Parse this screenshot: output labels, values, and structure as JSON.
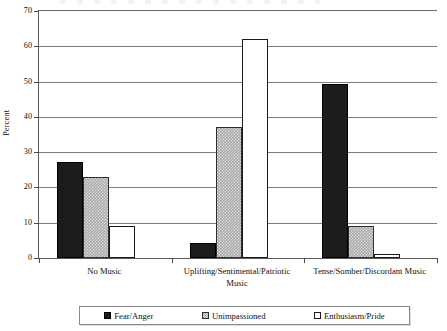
{
  "chart_data": {
    "type": "bar",
    "title": "",
    "xlabel": "",
    "ylabel": "Percent",
    "ylim": [
      0,
      70
    ],
    "ytick_step": 10,
    "yticks": [
      "0",
      "10",
      "20",
      "30",
      "40",
      "50",
      "60",
      "70"
    ],
    "grid": true,
    "legend_position": "bottom",
    "categories": [
      "No Music",
      "Uplifting/Sentimental/Patriotic Music",
      "Tense/Somber/Discordant Music"
    ],
    "category_lines": [
      [
        "No Music"
      ],
      [
        "Uplifting/Sentimental/Patriotic",
        "Music"
      ],
      [
        "Tense/Somber/Discordant Music"
      ]
    ],
    "series": [
      {
        "name": "Fear/Anger",
        "fill": "fill-dark",
        "values": [
          27.3,
          4.2,
          49.3
        ]
      },
      {
        "name": "Unimpassioned",
        "fill": "fill-hatch",
        "values": [
          23.1,
          37.0,
          9.1
        ]
      },
      {
        "name": "Enthusiasm/Pride",
        "fill": "fill-white",
        "values": [
          9.2,
          62.2,
          1.0
        ]
      }
    ]
  },
  "colors": {
    "fear_anger": "#1c1c1c",
    "unimpassioned": "#a9a9a9",
    "enthusiasm_pride": "#ffffff",
    "axis": "#5a5a5a",
    "gridline": "#7d7d7d",
    "text": "#111111"
  }
}
